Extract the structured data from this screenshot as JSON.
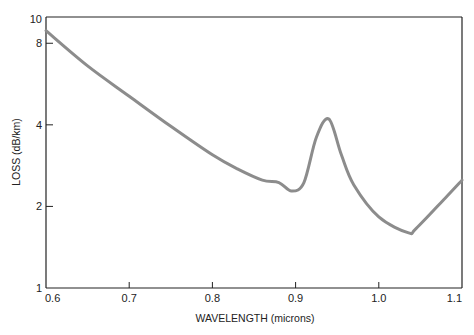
{
  "chart_data": {
    "type": "line",
    "title": "",
    "xlabel": "WAVELENGTH (microns)",
    "ylabel": "LOSS (dB/km)",
    "xlim": [
      0.6,
      1.1
    ],
    "ylim": [
      1,
      10
    ],
    "yscale": "log",
    "grid": false,
    "legend": null,
    "x_ticks": [
      "0.6",
      "0.7",
      "0.8",
      "0.9",
      "1.0",
      "1.1"
    ],
    "y_ticks": [
      "1",
      "2",
      "4",
      "8",
      "10"
    ],
    "series": [
      {
        "name": "loss",
        "color": "#8c8c8c",
        "x": [
          0.6,
          0.65,
          0.7,
          0.75,
          0.8,
          0.83,
          0.86,
          0.88,
          0.895,
          0.91,
          0.925,
          0.94,
          0.955,
          0.97,
          1.0,
          1.035,
          1.045,
          1.08,
          1.1
        ],
        "y": [
          8.9,
          6.6,
          5.1,
          3.95,
          3.1,
          2.75,
          2.5,
          2.45,
          2.28,
          2.45,
          3.6,
          4.2,
          3.1,
          2.4,
          1.83,
          1.6,
          1.66,
          2.15,
          2.5
        ]
      }
    ]
  }
}
